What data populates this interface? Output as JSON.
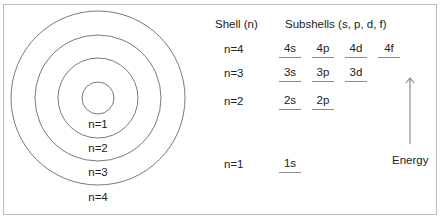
{
  "diagram": {
    "circles": {
      "center": [
        98,
        98
      ],
      "radii": [
        16,
        40,
        63,
        87
      ],
      "stroke": "#7a7a7a",
      "labels": [
        {
          "text": "n=1",
          "x": 98,
          "y": 123
        },
        {
          "text": "n=2",
          "x": 98,
          "y": 146
        },
        {
          "text": "n=3",
          "x": 98,
          "y": 170
        },
        {
          "text": "n=4",
          "x": 98,
          "y": 194
        }
      ]
    },
    "headers": {
      "shell": "Shell (n)",
      "subshells": "Subshells (s, p, d, f)"
    },
    "rows": [
      {
        "shell": "n=4",
        "subshells": [
          "4s",
          "4p",
          "4d",
          "4f"
        ]
      },
      {
        "shell": "n=3",
        "subshells": [
          "3s",
          "3p",
          "3d"
        ]
      },
      {
        "shell": "n=2",
        "subshells": [
          "2s",
          "2p"
        ]
      },
      {
        "shell": "n=1",
        "subshells": [
          "1s"
        ]
      }
    ],
    "energy_axis": {
      "label": "Energy",
      "arrow_color": "#8a8a8a"
    }
  }
}
